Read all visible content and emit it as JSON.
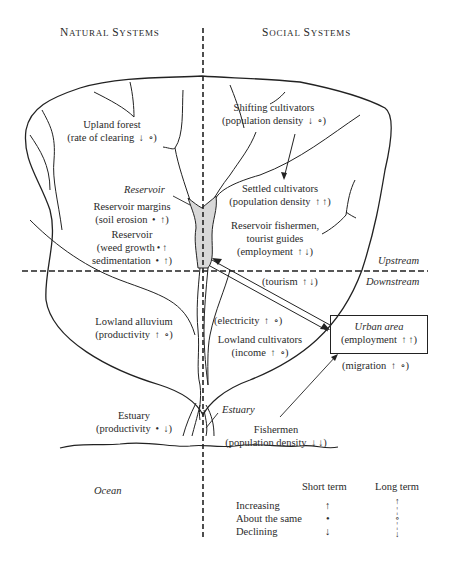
{
  "headers": {
    "natural": {
      "first_cap": "N",
      "rest": "ATURAL ",
      "first_cap2": "S",
      "rest2": "YSTEMS"
    },
    "social": {
      "first_cap": "S",
      "rest": "OCIAL ",
      "first_cap2": "S",
      "rest2": "YSTEMS"
    }
  },
  "zones": {
    "upstream": "Upstream",
    "downstream": "Downstream",
    "ocean": "Ocean",
    "reservoir_label": "Reservoir",
    "estuary_label": "Estuary"
  },
  "natural_items": [
    {
      "name": "Upland forest",
      "indicator": "(rate of clearing",
      "short": "declining",
      "long": "same"
    },
    {
      "name": "Reservoir margins",
      "indicator": "(soil erosion",
      "short": "same",
      "long": "increasing"
    },
    {
      "name": "Reservoir",
      "indicator": "(weed growth",
      "short": "same",
      "long": "increasing",
      "indicator2": "sedimentation",
      "short2": "same",
      "long2": "increasing"
    },
    {
      "name": "Lowland alluvium",
      "indicator": "(productivity",
      "short": "increasing",
      "long": "same"
    },
    {
      "name": "Estuary",
      "indicator": "(productivity",
      "short": "same",
      "long": "declining"
    }
  ],
  "social_items": [
    {
      "name": "Shifting cultivators",
      "indicator": "(population density",
      "short": "declining",
      "long": "same"
    },
    {
      "name": "Settled cultivators",
      "indicator": "(population density",
      "short": "increasing",
      "long": "increasing"
    },
    {
      "name": "Reservoir fishermen,",
      "name2": "tourist guides",
      "indicator": "(employment",
      "short": "increasing",
      "long": "declining"
    },
    {
      "indicator": "(tourism",
      "short": "increasing",
      "long": "declining"
    },
    {
      "indicator": "(electricity",
      "short": "increasing",
      "long": "same"
    },
    {
      "name": "Lowland cultivators",
      "indicator": "(income",
      "short": "increasing",
      "long": "same"
    },
    {
      "name": "Fishermen",
      "indicator": "(population density",
      "short": "declining",
      "long": "declining"
    }
  ],
  "urban": {
    "title": "Urban area",
    "indicator": "(employment",
    "short": "increasing",
    "long": "increasing",
    "migration": "(migration",
    "migration_short": "increasing",
    "migration_long": "same"
  },
  "legend": {
    "col_short": "Short term",
    "col_long": "Long term",
    "rows": [
      {
        "label": "Increasing",
        "short": "increasing",
        "long": "increasing"
      },
      {
        "label": "About the same",
        "short": "same",
        "long": "same"
      },
      {
        "label": "Declining",
        "short": "declining",
        "long": "declining"
      }
    ]
  },
  "symbols": {
    "short": {
      "increasing": "↑",
      "same": "•",
      "declining": "↓"
    },
    "long": {
      "increasing": "↑",
      "same": "∘",
      "declining": "↓"
    }
  }
}
